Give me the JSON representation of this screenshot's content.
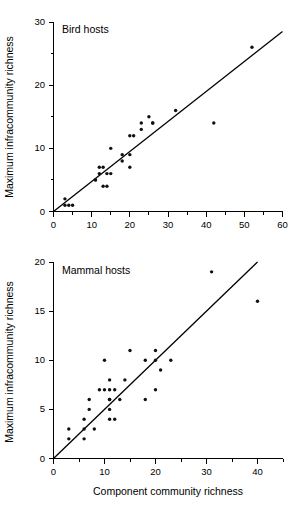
{
  "figure": {
    "background_color": "#ffffff",
    "ink_color": "#000000",
    "shared_xlabel": "Component community richness",
    "shared_ylabel": "Maximum infracommunity richness"
  },
  "chart_data": [
    {
      "type": "scatter",
      "title": "Bird hosts",
      "xlabel": "",
      "ylabel": "Maximum infracommunity richness",
      "xlim": [
        0,
        60
      ],
      "ylim": [
        0,
        30
      ],
      "xticks": [
        0,
        10,
        20,
        30,
        40,
        50,
        60
      ],
      "yticks": [
        0,
        10,
        20,
        30
      ],
      "xtick_labels": [
        "0",
        "10",
        "20",
        "30",
        "40",
        "50",
        "60"
      ],
      "ytick_labels": [
        "0",
        "10",
        "20",
        "30"
      ],
      "minor_xticks": [
        5,
        15,
        25,
        35,
        45,
        55
      ],
      "minor_yticks": [
        5,
        15,
        25
      ],
      "grid": false,
      "legend": "none",
      "marker": "filled-circle",
      "marker_size": 2,
      "points": [
        {
          "x": 3,
          "y": 2
        },
        {
          "x": 3,
          "y": 1
        },
        {
          "x": 4,
          "y": 1
        },
        {
          "x": 5,
          "y": 1
        },
        {
          "x": 11,
          "y": 5
        },
        {
          "x": 11,
          "y": 5
        },
        {
          "x": 12,
          "y": 6
        },
        {
          "x": 12,
          "y": 7
        },
        {
          "x": 13,
          "y": 7
        },
        {
          "x": 13,
          "y": 4
        },
        {
          "x": 14,
          "y": 4
        },
        {
          "x": 14,
          "y": 6
        },
        {
          "x": 15,
          "y": 6
        },
        {
          "x": 15,
          "y": 10
        },
        {
          "x": 18,
          "y": 8
        },
        {
          "x": 18,
          "y": 9
        },
        {
          "x": 20,
          "y": 7
        },
        {
          "x": 20,
          "y": 9
        },
        {
          "x": 20,
          "y": 12
        },
        {
          "x": 21,
          "y": 12
        },
        {
          "x": 23,
          "y": 13
        },
        {
          "x": 23,
          "y": 14
        },
        {
          "x": 25,
          "y": 15
        },
        {
          "x": 26,
          "y": 14
        },
        {
          "x": 26,
          "y": 14
        },
        {
          "x": 32,
          "y": 16
        },
        {
          "x": 42,
          "y": 14
        },
        {
          "x": 52,
          "y": 26
        }
      ],
      "fit_line": {
        "x_start": 0,
        "y_start": 0,
        "x_end": 60,
        "y_end": 28.5,
        "description": "regression line through origin"
      }
    },
    {
      "type": "scatter",
      "title": "Mammal hosts",
      "xlabel": "Component community richness",
      "ylabel": "Maximum infracommunity richness",
      "xlim": [
        0,
        45
      ],
      "ylim": [
        0,
        20
      ],
      "xticks": [
        0,
        10,
        20,
        30,
        40
      ],
      "yticks": [
        0,
        5,
        10,
        15,
        20
      ],
      "xtick_labels": [
        "0",
        "10",
        "20",
        "30",
        "40"
      ],
      "ytick_labels": [
        "0",
        "5",
        "10",
        "15",
        "20"
      ],
      "minor_xticks": [
        5,
        15,
        25,
        35
      ],
      "minor_yticks": [],
      "grid": false,
      "legend": "none",
      "marker": "filled-circle",
      "marker_size": 2,
      "points": [
        {
          "x": 3,
          "y": 3
        },
        {
          "x": 3,
          "y": 2
        },
        {
          "x": 6,
          "y": 4
        },
        {
          "x": 6,
          "y": 3
        },
        {
          "x": 6,
          "y": 2
        },
        {
          "x": 7,
          "y": 6
        },
        {
          "x": 7,
          "y": 5
        },
        {
          "x": 8,
          "y": 3
        },
        {
          "x": 9,
          "y": 7
        },
        {
          "x": 10,
          "y": 7
        },
        {
          "x": 10,
          "y": 10
        },
        {
          "x": 11,
          "y": 8
        },
        {
          "x": 11,
          "y": 7
        },
        {
          "x": 11,
          "y": 6
        },
        {
          "x": 11,
          "y": 6
        },
        {
          "x": 11,
          "y": 5
        },
        {
          "x": 11,
          "y": 4
        },
        {
          "x": 12,
          "y": 7
        },
        {
          "x": 12,
          "y": 4
        },
        {
          "x": 13,
          "y": 6
        },
        {
          "x": 14,
          "y": 8
        },
        {
          "x": 15,
          "y": 11
        },
        {
          "x": 18,
          "y": 10
        },
        {
          "x": 18,
          "y": 6
        },
        {
          "x": 20,
          "y": 11
        },
        {
          "x": 20,
          "y": 10
        },
        {
          "x": 20,
          "y": 7
        },
        {
          "x": 21,
          "y": 9
        },
        {
          "x": 23,
          "y": 10
        },
        {
          "x": 31,
          "y": 19
        },
        {
          "x": 40,
          "y": 16
        }
      ],
      "fit_line": {
        "x_start": 0,
        "y_start": 0,
        "x_end": 40,
        "y_end": 20,
        "description": "regression line through origin"
      }
    }
  ]
}
